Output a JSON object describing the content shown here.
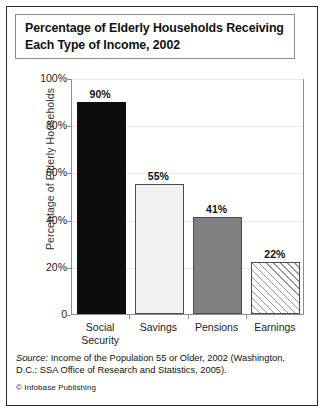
{
  "figure": {
    "title": "Percentage of Elderly Households Receiving\nEach Type of Income, 2002",
    "source_prefix": "Source:",
    "source_rest": " Income of the Population 55 or Older, 2002 (Washington, D.C.: SSA Office of Research and Statistics, 2005).",
    "copyright": "© Infobase Publishing"
  },
  "colors": {
    "social_security": "#0d0d0d",
    "savings": "#f1f1f1",
    "pensions": "#808080",
    "earnings_hatch": "#9a9a9a",
    "bar_border": "#4d4d4d",
    "frame": "#8c8c8c",
    "grid": "#e8e8e8",
    "outer_border": "#2b2b2b"
  },
  "chart_data": {
    "type": "bar",
    "title": "Percentage of Elderly Households Receiving Each Type of Income, 2002",
    "xlabel": "",
    "ylabel": "Percentage of Elderly Households",
    "categories": [
      "Social\nSecurity",
      "Savings",
      "Pensions",
      "Earnings"
    ],
    "values": [
      90,
      55,
      41,
      22
    ],
    "value_labels": [
      "90%",
      "55%",
      "41%",
      "22%"
    ],
    "ylim": [
      0,
      100
    ],
    "yticks": [
      0,
      20,
      40,
      60,
      80,
      100
    ],
    "ytick_labels": [
      "0",
      "20%",
      "40%",
      "60%",
      "80%",
      "100%"
    ],
    "grid": true,
    "legend": "none",
    "bar_styles": [
      "solid-black",
      "solid-light",
      "solid-gray",
      "diagonal-hatch"
    ]
  }
}
